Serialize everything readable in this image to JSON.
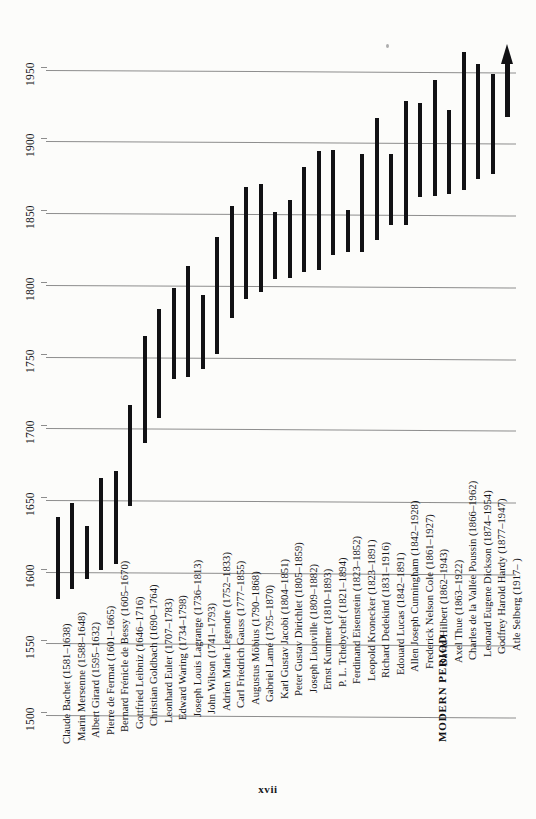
{
  "page": {
    "folio": "xvii",
    "section_label": "MODERN PERIOD"
  },
  "chart_data": {
    "type": "bar",
    "title": "",
    "subtitle": "",
    "xlabel": "",
    "ylabel": "Year",
    "orientation": "vertical-bars-on-rotated-page",
    "grid": true,
    "legend": false,
    "axis_ticks": [
      1500,
      1550,
      1600,
      1650,
      1700,
      1750,
      1800,
      1850,
      1900,
      1950
    ],
    "ylim": [
      1500,
      1975
    ],
    "note": "Each bar is a lifespan; label gives name with birth-death years.",
    "categories": [
      "Claude Bachet (1581–1638)",
      "Marin Mersenne (1588–1648)",
      "Albert Girard (1595–1632)",
      "Pierre de Fermat (1601–1665)",
      "Bernard Frénicle de Bessy (1605–1670)",
      "Gottfried Leibniz (1646–1716)",
      "Christian Goldbach (1690–1764)",
      "Leonhard Euler (1707–1783)",
      "Edward Waring (1734–1798)",
      "Joseph Louis Lagrange (1736–1813)",
      "John Wilson (1741–1793)",
      "Adrien Marie Legendre (1752–1833)",
      "Carl Friedrich Gauss (1777–1855)",
      "Augustus Möbius (1790–1868)",
      "Gabriel Lamé (1795–1870)",
      "Karl Gustav Jacobi (1804–1851)",
      "Peter Gustav Dirichlet (1805–1859)",
      "Joseph Liouville (1809–1882)",
      "Ernst Kummer (1810–1893)",
      "P. L. Tchebychef (1821–1894)",
      "Ferdinand Eisenstein (1823–1852)",
      "Leopold Kronecker (1823–1891)",
      "Richard Dedekind (1831–1916)",
      "Edouard Lucas (1842–1891)",
      "Allen Joseph Cunningham (1842–1928)",
      "Frederick Nelson Cole (1861–1927)",
      "David Hilbert (1862–1943)",
      "Axel Thue (1863–1922)",
      "Charles de la Vallée Poussin (1866–1962)",
      "Leonard Eugene Dickson (1874–1954)",
      "Godfrey Harold Hardy (1877–1947)",
      "Atle Selberg (1917–      )"
    ],
    "series": [
      {
        "name": "lifespan",
        "spans": [
          {
            "label": "Claude Bachet (1581–1638)",
            "start": 1581,
            "end": 1638
          },
          {
            "label": "Marin Mersenne (1588–1648)",
            "start": 1588,
            "end": 1648
          },
          {
            "label": "Albert Girard (1595–1632)",
            "start": 1595,
            "end": 1632
          },
          {
            "label": "Pierre de Fermat (1601–1665)",
            "start": 1601,
            "end": 1665
          },
          {
            "label": "Bernard Frénicle de Bessy (1605–1670)",
            "start": 1605,
            "end": 1670
          },
          {
            "label": "Gottfried Leibniz (1646–1716)",
            "start": 1646,
            "end": 1716
          },
          {
            "label": "Christian Goldbach (1690–1764)",
            "start": 1690,
            "end": 1764
          },
          {
            "label": "Leonhard Euler (1707–1783)",
            "start": 1707,
            "end": 1783
          },
          {
            "label": "Edward Waring (1734–1798)",
            "start": 1734,
            "end": 1798
          },
          {
            "label": "Joseph Louis Lagrange (1736–1813)",
            "start": 1736,
            "end": 1813
          },
          {
            "label": "John Wilson (1741–1793)",
            "start": 1741,
            "end": 1793
          },
          {
            "label": "Adrien Marie Legendre (1752–1833)",
            "start": 1752,
            "end": 1833
          },
          {
            "label": "Carl Friedrich Gauss (1777–1855)",
            "start": 1777,
            "end": 1855
          },
          {
            "label": "Augustus Möbius (1790–1868)",
            "start": 1790,
            "end": 1868
          },
          {
            "label": "Gabriel Lamé (1795–1870)",
            "start": 1795,
            "end": 1870
          },
          {
            "label": "Karl Gustav Jacobi (1804–1851)",
            "start": 1804,
            "end": 1851
          },
          {
            "label": "Peter Gustav Dirichlet (1805–1859)",
            "start": 1805,
            "end": 1859
          },
          {
            "label": "Joseph Liouville (1809–1882)",
            "start": 1809,
            "end": 1882
          },
          {
            "label": "Ernst Kummer (1810–1893)",
            "start": 1810,
            "end": 1893
          },
          {
            "label": "P. L. Tchebychef (1821–1894)",
            "start": 1821,
            "end": 1894
          },
          {
            "label": "Ferdinand Eisenstein (1823–1852)",
            "start": 1823,
            "end": 1852
          },
          {
            "label": "Leopold Kronecker (1823–1891)",
            "start": 1823,
            "end": 1891
          },
          {
            "label": "Richard Dedekind (1831–1916)",
            "start": 1831,
            "end": 1916
          },
          {
            "label": "Edouard Lucas (1842–1891)",
            "start": 1842,
            "end": 1891
          },
          {
            "label": "Allen Joseph Cunningham (1842–1928)",
            "start": 1842,
            "end": 1928
          },
          {
            "label": "Frederick Nelson Cole (1861–1927)",
            "start": 1861,
            "end": 1927
          },
          {
            "label": "David Hilbert (1862–1943)",
            "start": 1862,
            "end": 1943
          },
          {
            "label": "Axel Thue (1863–1922)",
            "start": 1863,
            "end": 1922
          },
          {
            "label": "Charles de la Vallée Poussin (1866–1962)",
            "start": 1866,
            "end": 1962
          },
          {
            "label": "Leonard Eugene Dickson (1874–1954)",
            "start": 1874,
            "end": 1954
          },
          {
            "label": "Godfrey Harold Hardy (1877–1947)",
            "start": 1877,
            "end": 1947
          },
          {
            "label": "Atle Selberg (1917–      )",
            "start": 1917,
            "end": 1975,
            "open_ended": true
          }
        ]
      }
    ]
  }
}
